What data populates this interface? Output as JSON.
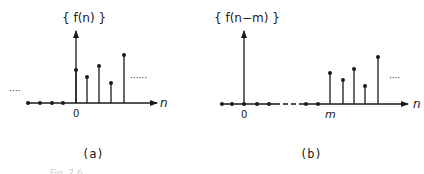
{
  "panels": [
    {
      "id": "a",
      "title": "{ f(n) }",
      "caption": "(a)",
      "axis_label": "n",
      "origin_label": "0",
      "left_ellipsis": "····",
      "right_ellipsis": "······",
      "axis": {
        "x1": 28,
        "x2": 157,
        "y": 103,
        "arrow_tip": 157
      },
      "vertical_arrow": {
        "x": 76,
        "top": 31
      },
      "zero_dots_x": [
        28,
        40,
        52,
        63
      ],
      "stems": [
        {
          "x": 76,
          "top": 70
        },
        {
          "x": 87,
          "top": 77
        },
        {
          "x": 99,
          "top": 66
        },
        {
          "x": 111,
          "top": 83
        },
        {
          "x": 124,
          "top": 55
        }
      ]
    },
    {
      "id": "b",
      "title": "{ f(n−m) }",
      "caption": "(b)",
      "axis_label": "n",
      "origin_label": "0",
      "shift_label": "m",
      "right_ellipsis": "····",
      "axis": {
        "x1": 222,
        "x2": 408,
        "y": 104,
        "arrow_tip": 408
      },
      "vertical_arrow": {
        "x": 244,
        "top": 31
      },
      "zero_dots_x": [
        222,
        232,
        244,
        257,
        269,
        306,
        318
      ],
      "dashed_segment": {
        "x1": 275,
        "x2": 303
      },
      "stems": [
        {
          "x": 330,
          "top": 73
        },
        {
          "x": 343,
          "top": 80
        },
        {
          "x": 354,
          "top": 69
        },
        {
          "x": 365,
          "top": 86
        },
        {
          "x": 378,
          "top": 57
        }
      ]
    }
  ],
  "figure_caption": "Fig. 7.6"
}
